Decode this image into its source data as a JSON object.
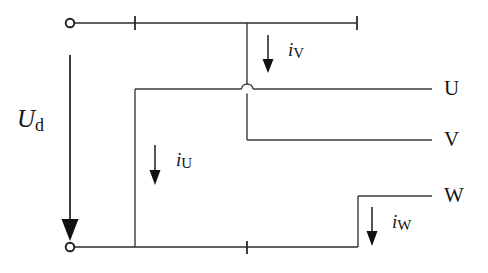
{
  "diagram": {
    "type": "electrical-schematic",
    "background_color": "#ffffff",
    "wire_color": "#2b2b2b",
    "label_color": "#141414",
    "width": 488,
    "height": 273
  },
  "terminals": {
    "dc_positive": {
      "label": "",
      "x": 70,
      "y": 23,
      "shape": "open-circle"
    },
    "dc_negative": {
      "label": "",
      "x": 70,
      "y": 247,
      "shape": "open-circle"
    }
  },
  "phase_labels": {
    "u": "U",
    "v": "V",
    "w": "W"
  },
  "current_labels": {
    "u": {
      "symbol": "i",
      "subscript": "U"
    },
    "v": {
      "symbol": "i",
      "subscript": "V"
    },
    "w": {
      "symbol": "i",
      "subscript": "W"
    }
  },
  "voltage_label": {
    "symbol": "U",
    "subscript": "d"
  },
  "nodes": {
    "top_rail_y": 23,
    "bottom_rail_y": 247,
    "rail_left_x": 70,
    "top_rail_right_x": 357,
    "bottom_rail_right_x": 358,
    "u_branch_x": 135,
    "v_branch_x": 247,
    "w_branch_x": 358,
    "u_line_y": 89,
    "v_line_y": 140,
    "w_line_y": 196,
    "output_right_x": 432
  },
  "arrows": {
    "ud": {
      "x": 70,
      "y_start": 55,
      "y_end": 240,
      "head": "large"
    },
    "iv": {
      "x": 268,
      "y_start": 35,
      "y_end": 72,
      "head": "small"
    },
    "iu": {
      "x": 155,
      "y_start": 145,
      "y_end": 185,
      "head": "small"
    },
    "iw": {
      "x": 372,
      "y_start": 207,
      "y_end": 247,
      "head": "small"
    }
  }
}
